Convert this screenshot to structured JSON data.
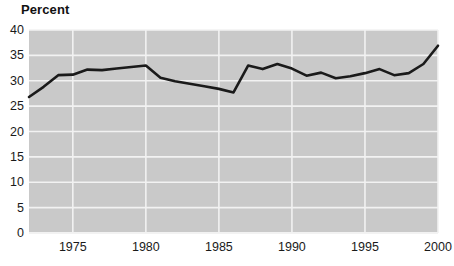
{
  "chart_data": {
    "type": "line",
    "title": "Percent",
    "xlabel": "",
    "ylabel": "Percent",
    "xlim": [
      1972,
      2000
    ],
    "ylim": [
      0,
      40
    ],
    "grid": true,
    "legend": "none",
    "xticks": [
      "1975",
      "1980",
      "1985",
      "1990",
      "1995",
      "2000"
    ],
    "xtick_values": [
      1975,
      1980,
      1985,
      1990,
      1995,
      2000
    ],
    "yticks": [
      "0",
      "5",
      "10",
      "15",
      "20",
      "25",
      "30",
      "35",
      "40"
    ],
    "ytick_values": [
      0,
      5,
      10,
      15,
      20,
      25,
      30,
      35,
      40
    ],
    "x": [
      1972,
      1973,
      1974,
      1975,
      1976,
      1977,
      1978,
      1979,
      1980,
      1981,
      1982,
      1983,
      1984,
      1985,
      1986,
      1987,
      1988,
      1989,
      1990,
      1991,
      1992,
      1993,
      1994,
      1995,
      1996,
      1997,
      1998,
      1999,
      2000
    ],
    "values": [
      26.8,
      28.8,
      31.1,
      31.2,
      32.2,
      32.1,
      32.4,
      32.7,
      33.0,
      30.6,
      29.9,
      29.4,
      28.9,
      28.4,
      27.7,
      33.0,
      32.3,
      33.3,
      32.4,
      31.0,
      31.6,
      30.5,
      30.9,
      31.5,
      32.3,
      31.1,
      31.5,
      33.3,
      36.9
    ],
    "series": [
      {
        "name": "Percent",
        "color": "#1a1a1a",
        "values": [
          26.8,
          28.8,
          31.1,
          31.2,
          32.2,
          32.1,
          32.4,
          32.7,
          33.0,
          30.6,
          29.9,
          29.4,
          28.9,
          28.4,
          27.7,
          33.0,
          32.3,
          33.3,
          32.4,
          31.0,
          31.6,
          30.5,
          30.9,
          31.5,
          32.3,
          31.1,
          31.5,
          33.3,
          36.9
        ]
      }
    ],
    "colors": {
      "plot_background": "#c9c9c9",
      "gridline": "#f2f2f2",
      "line": "#1a1a1a",
      "text": "#1a1a1a",
      "figure_background": "#ffffff"
    }
  }
}
